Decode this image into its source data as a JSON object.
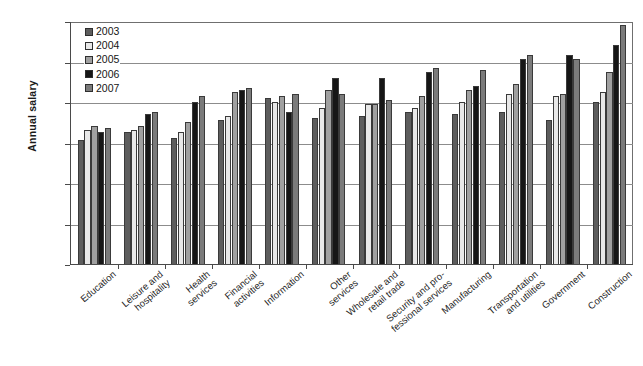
{
  "chart_data": {
    "type": "bar",
    "title": "",
    "xlabel": "",
    "ylabel": "Annual salary",
    "ylim": [
      0,
      120000
    ],
    "ytick_labels": [
      "$120k",
      "$100k",
      "$80k",
      "$60k",
      "$40k",
      "$20k",
      "0"
    ],
    "ytick_values": [
      120000,
      100000,
      80000,
      60000,
      40000,
      20000,
      0
    ],
    "grid": true,
    "grid_axis": "y",
    "legend_position": "top-left",
    "units": "US dollars",
    "categories": [
      "Education",
      "Leisure and hospitality",
      "Health services",
      "Financial activities",
      "Information",
      "Other services",
      "Wholesale and retail trade",
      "Security and pro-fessional services",
      "Manufacturing",
      "Transportation and utilities",
      "Government",
      "Construction"
    ],
    "category_label_lines": [
      [
        "Education"
      ],
      [
        "Leisure and",
        "hospitality"
      ],
      [
        "Health",
        "services"
      ],
      [
        "Financial",
        "activities"
      ],
      [
        "Information"
      ],
      [
        "Other",
        "services"
      ],
      [
        "Wholesale and",
        "retail trade"
      ],
      [
        "Security and pro-",
        "fessional services"
      ],
      [
        "Manufacturing"
      ],
      [
        "Transportation",
        "and utilities"
      ],
      [
        "Government"
      ],
      [
        "Construction"
      ]
    ],
    "series": [
      {
        "name": "2003",
        "color": "#5d5d5d",
        "values": [
          61000,
          65000,
          62000,
          71000,
          82000,
          72000,
          73000,
          75000,
          74000,
          75000,
          71000,
          80000
        ]
      },
      {
        "name": "2004",
        "color": "#e8e8e8",
        "values": [
          66000,
          66000,
          65000,
          73000,
          80000,
          77000,
          79000,
          77000,
          80000,
          84000,
          83000,
          85000
        ]
      },
      {
        "name": "2005",
        "color": "#a0a0a0",
        "values": [
          68000,
          68000,
          70000,
          85000,
          83000,
          86000,
          79000,
          83000,
          86000,
          89000,
          84000,
          95000
        ]
      },
      {
        "name": "2006",
        "color": "#161616",
        "values": [
          65000,
          74000,
          80000,
          86000,
          75000,
          92000,
          92000,
          95000,
          88000,
          101000,
          103000,
          108000
        ]
      },
      {
        "name": "2007",
        "color": "#7b7b7b",
        "values": [
          67000,
          75000,
          83000,
          87000,
          84000,
          84000,
          81000,
          97000,
          96000,
          103000,
          101000,
          118000
        ]
      }
    ]
  },
  "legend": {
    "entries": [
      {
        "label": "2003",
        "swatch": "y2003"
      },
      {
        "label": "2004",
        "swatch": "y2004"
      },
      {
        "label": "2005",
        "swatch": "y2005"
      },
      {
        "label": "2006",
        "swatch": "y2006"
      },
      {
        "label": "2007",
        "swatch": "y2007"
      }
    ]
  }
}
